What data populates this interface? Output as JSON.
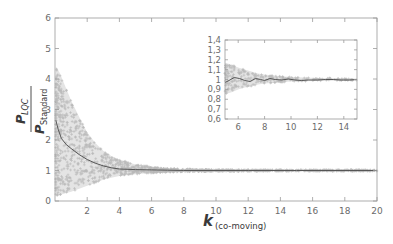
{
  "chart_data": [
    {
      "id": "main",
      "type": "scatter",
      "title": "",
      "xlabel": "k",
      "xlabel_subscript": "(co-moving)",
      "ylabel_numerator": "P",
      "ylabel_numerator_subscript": "LQC",
      "ylabel_denominator": "P",
      "ylabel_denominator_subscript": "Standard",
      "xlim": [
        0,
        20
      ],
      "ylim": [
        0,
        6
      ],
      "xticks": [
        2,
        4,
        6,
        8,
        10,
        12,
        14,
        16,
        18,
        20
      ],
      "yticks": [
        0,
        1,
        2,
        3,
        4,
        5,
        6
      ],
      "grid": false,
      "legend": null,
      "series": [
        {
          "name": "samples (scatter envelope)",
          "kind": "band",
          "color": "#b5b5b5",
          "x": [
            0.05,
            0.3,
            0.6,
            1.0,
            1.5,
            2.0,
            2.5,
            3.0,
            3.5,
            4.0,
            5.0,
            6.0,
            7.0,
            8.0,
            10.0,
            12.0,
            15.0,
            20.0
          ],
          "upper": [
            4.4,
            4.2,
            3.8,
            3.3,
            2.75,
            2.25,
            1.9,
            1.65,
            1.48,
            1.36,
            1.2,
            1.12,
            1.07,
            1.05,
            1.03,
            1.025,
            1.02,
            1.02
          ],
          "lower": [
            0.15,
            0.2,
            0.25,
            0.3,
            0.4,
            0.5,
            0.6,
            0.7,
            0.76,
            0.82,
            0.88,
            0.92,
            0.94,
            0.96,
            0.97,
            0.975,
            0.98,
            0.98
          ]
        },
        {
          "name": "mean",
          "kind": "line",
          "color": "#555555",
          "x": [
            0.05,
            0.2,
            0.4,
            0.7,
            1.0,
            1.5,
            2.0,
            2.5,
            3.0,
            3.5,
            4.0,
            5.0,
            6.0,
            7.0,
            8.0,
            10.0,
            12.0,
            15.0,
            20.0
          ],
          "y": [
            2.65,
            2.35,
            2.05,
            1.85,
            1.72,
            1.52,
            1.36,
            1.24,
            1.15,
            1.09,
            1.05,
            1.03,
            1.02,
            1.01,
            1.0,
            1.0,
            1.0,
            1.0,
            1.0
          ]
        }
      ]
    },
    {
      "id": "inset",
      "type": "scatter",
      "title": "",
      "xlim": [
        5,
        15
      ],
      "ylim": [
        0.6,
        1.4
      ],
      "xticks": [
        6,
        8,
        10,
        12,
        14
      ],
      "yticks": [
        0.6,
        0.7,
        0.8,
        0.9,
        1.0,
        1.1,
        1.2,
        1.3,
        1.4
      ],
      "ytick_labels": [
        "0,6",
        "0,7",
        "0,8",
        "0,9",
        "1",
        "1,1",
        "1,2",
        "1,3",
        "1,4"
      ],
      "xtick_labels": [
        "6",
        "8",
        "10",
        "12",
        "14"
      ],
      "grid": false,
      "series": [
        {
          "name": "samples (scatter envelope)",
          "kind": "band",
          "color": "#b5b5b5",
          "x": [
            5.0,
            5.5,
            6.0,
            6.5,
            7.0,
            7.5,
            8.0,
            9.0,
            10.0,
            11.0,
            12.0,
            13.0,
            14.0,
            15.0
          ],
          "upper": [
            1.17,
            1.15,
            1.12,
            1.1,
            1.08,
            1.06,
            1.05,
            1.035,
            1.025,
            1.02,
            1.015,
            1.015,
            1.01,
            1.01
          ],
          "lower": [
            0.85,
            0.87,
            0.9,
            0.92,
            0.93,
            0.95,
            0.96,
            0.97,
            0.98,
            0.982,
            0.985,
            0.987,
            0.99,
            0.99
          ]
        },
        {
          "name": "mean",
          "kind": "line",
          "color": "#555555",
          "x": [
            5.0,
            5.3,
            5.7,
            6.1,
            6.5,
            6.9,
            7.3,
            7.7,
            8.0,
            8.4,
            8.8,
            9.3,
            9.8,
            10.3,
            10.8,
            11.3,
            12.0,
            12.6,
            13.2,
            13.8,
            14.4,
            15.0
          ],
          "y": [
            0.97,
            0.99,
            1.02,
            1.01,
            0.99,
            0.98,
            1.01,
            1.0,
            0.99,
            1.01,
            1.0,
            0.995,
            1.005,
            0.995,
            0.99,
            0.995,
            0.995,
            1.0,
            1.0,
            0.995,
            0.995,
            1.0
          ]
        }
      ]
    }
  ],
  "labels": {
    "x_main": "k",
    "x_sub": "(co-moving)",
    "y_num": "P",
    "y_num_sub": "LQC",
    "y_den": "P",
    "y_den_sub": "Standard"
  },
  "colors": {
    "axis": "#9a9a9a",
    "scatter": "#b8b8b8",
    "line": "#555555",
    "text": "#6b6b6b"
  }
}
